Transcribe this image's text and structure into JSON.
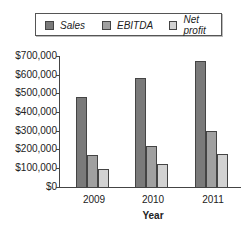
{
  "legend": {
    "items": [
      {
        "label": "Sales",
        "color": "#7a7a7a"
      },
      {
        "label": "EBITDA",
        "color": "#a0a0a0"
      },
      {
        "label": "Net profit",
        "color": "#d2d2d2"
      }
    ]
  },
  "axes": {
    "y_ticks": [
      "$700,000",
      "$600,000",
      "$500,000",
      "$400,000",
      "$300,000",
      "$200,000",
      "$100,000",
      "$0"
    ],
    "x_ticks": [
      "2009",
      "2010",
      "2011"
    ],
    "x_title": "Year"
  },
  "chart_data": {
    "type": "bar",
    "title": "",
    "categories": [
      "2009",
      "2010",
      "2011"
    ],
    "series": [
      {
        "name": "Sales",
        "values": [
          480000,
          580000,
          675000
        ]
      },
      {
        "name": "EBITDA",
        "values": [
          170000,
          220000,
          300000
        ]
      },
      {
        "name": "Net profit",
        "values": [
          95000,
          125000,
          175000
        ]
      }
    ],
    "xlabel": "Year",
    "ylabel": "",
    "ylim": [
      0,
      700000
    ],
    "y_tick_step": 100000,
    "grid": false,
    "legend_position": "top"
  }
}
